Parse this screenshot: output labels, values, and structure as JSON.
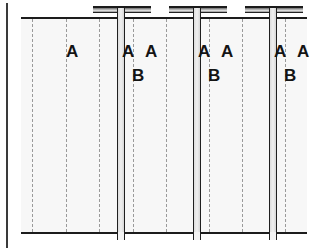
{
  "figure": {
    "name": "panel-joint-cross-section",
    "background_color": "#ffffff",
    "plate_fill_color": "#f7f7f7",
    "line_color": "#1c1c1c",
    "centre_line_color": "#9a9a9a",
    "plate": {
      "left": 21,
      "top": 17,
      "width": 286,
      "height": 217
    }
  },
  "labels": {
    "panel_letter": "A",
    "rib_letter": "B",
    "panel_callouts": [
      {
        "text": "A",
        "x": 45,
        "y": 26
      },
      {
        "text": "A",
        "x": 101,
        "y": 26
      },
      {
        "text": "A",
        "x": 124,
        "y": 26
      },
      {
        "text": "A",
        "x": 177,
        "y": 26
      },
      {
        "text": "A",
        "x": 200,
        "y": 26
      },
      {
        "text": "A",
        "x": 253,
        "y": 26
      },
      {
        "text": "A",
        "x": 276,
        "y": 26
      }
    ],
    "rib_callouts": [
      {
        "text": "B",
        "x": 111,
        "y": 50
      },
      {
        "text": "B",
        "x": 187,
        "y": 50
      },
      {
        "text": "B",
        "x": 263,
        "y": 50
      }
    ]
  },
  "geometry": {
    "centre_lines_x": [
      11,
      45,
      78,
      112,
      145,
      188,
      221,
      264
    ],
    "ribs": [
      {
        "web_x": 96,
        "flange_x": 72,
        "flange_width": 58
      },
      {
        "web_x": 172,
        "flange_x": 148,
        "flange_width": 58
      },
      {
        "web_x": 248,
        "flange_x": 224,
        "flange_width": 58
      }
    ],
    "seams_x": [
      70,
      146,
      222,
      284
    ],
    "rule_x": 6
  }
}
